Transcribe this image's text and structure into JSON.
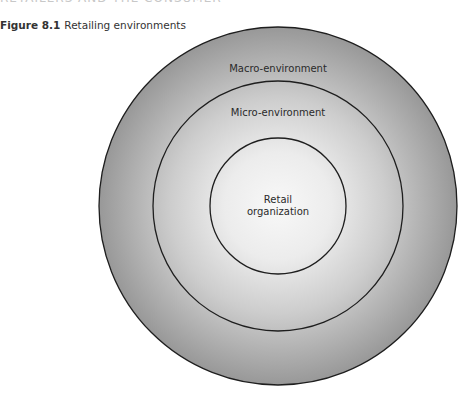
{
  "page": {
    "running_header": "RETAILERS AND THE CONSUMER"
  },
  "figure": {
    "number": "Figure 8.1",
    "title": "Retailing environments"
  },
  "diagram": {
    "type": "concentric-circles",
    "center": [
      278,
      206
    ],
    "rings": [
      {
        "id": "macro",
        "label": "Macro-environment",
        "radius": 179,
        "label_y": 72
      },
      {
        "id": "micro",
        "label": "Micro-environment",
        "radius": 125,
        "label_y": 116
      },
      {
        "id": "retail",
        "label_lines": [
          "Retail",
          "organization"
        ],
        "radius": 68,
        "label_y": 203
      }
    ],
    "colors": {
      "center_fill": "#f7f7f7",
      "mid_fill": "#cfcfcf",
      "edge_fill": "#999999",
      "stroke": "#1e1e1e"
    }
  }
}
